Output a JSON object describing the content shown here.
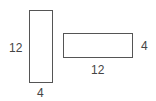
{
  "diagram": {
    "shapes": [
      {
        "name": "tall-rectangle",
        "height_label": "12",
        "width_label": "4"
      },
      {
        "name": "wide-rectangle",
        "height_label": "4",
        "width_label": "12"
      }
    ],
    "line_color": "#555555",
    "text_color": "#444444"
  }
}
